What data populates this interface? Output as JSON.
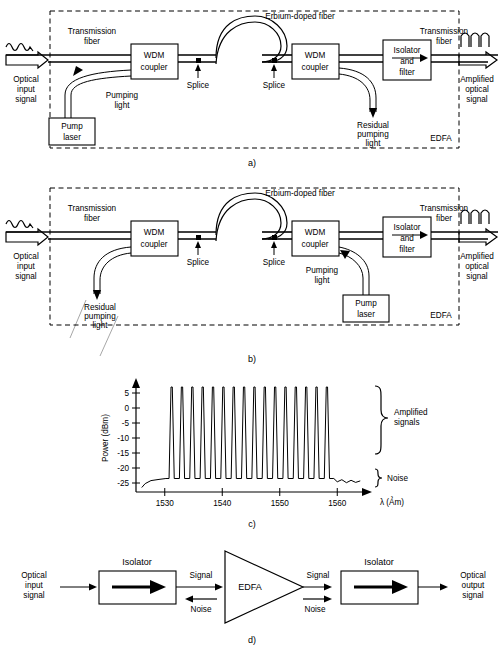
{
  "figure": {
    "panel_captions": {
      "a": "a)",
      "b": "b)",
      "c": "c)",
      "d": "d)"
    }
  },
  "panel_a": {
    "caption": "a)",
    "enclosure_label": "EDFA",
    "labels": {
      "optical_input_signal": [
        "Optical",
        "input",
        "signal"
      ],
      "transmission_fiber_left": [
        "Transmission",
        "fiber"
      ],
      "transmission_fiber_right": [
        "Transmission",
        "fiber"
      ],
      "wdm_coupler_left": [
        "WDM",
        "coupler"
      ],
      "wdm_coupler_right": [
        "WDM",
        "coupler"
      ],
      "pump_laser": [
        "Pump",
        "laser"
      ],
      "pumping_light": [
        "Pumping",
        "light"
      ],
      "residual_pumping_light": [
        "Residual",
        "pumping",
        "light"
      ],
      "splice_left": "Splice",
      "splice_right": "Splice",
      "erbium_doped_fiber": "Erbium-doped fiber",
      "isolator_and_filter": [
        "Isolator",
        "and",
        "filter"
      ],
      "amplified_optical_signal": [
        "Amplified",
        "optical",
        "signal"
      ]
    },
    "pump_position": "co-propagating (forward pumping at input side)"
  },
  "panel_b": {
    "caption": "b)",
    "enclosure_label": "EDFA",
    "labels": {
      "optical_input_signal": [
        "Optical",
        "input",
        "signal"
      ],
      "transmission_fiber_left": [
        "Transmission",
        "fiber"
      ],
      "transmission_fiber_right": [
        "Transmission",
        "fiber"
      ],
      "wdm_coupler_left": [
        "WDM",
        "coupler"
      ],
      "wdm_coupler_right": [
        "WDM",
        "coupler"
      ],
      "pump_laser": [
        "Pump",
        "laser"
      ],
      "pumping_light": [
        "Pumping",
        "light"
      ],
      "residual_pumping_light": [
        "Residual",
        "pumping",
        "light"
      ],
      "splice_left": "Splice",
      "splice_right": "Splice",
      "erbium_doped_fiber": "Erbium-doped fiber",
      "isolator_and_filter": [
        "Isolator",
        "and",
        "filter"
      ],
      "amplified_optical_signal": [
        "Amplified",
        "optical",
        "signal"
      ]
    },
    "pump_position": "counter-propagating (backward pumping at output side)"
  },
  "panel_c": {
    "caption": "c)",
    "annotations": {
      "amplified_signals": [
        "Amplified",
        "signals"
      ],
      "noise": "Noise"
    }
  },
  "chart_data": {
    "type": "line",
    "title": "",
    "xlabel": "λ (Ảm)",
    "ylabel": "Power (dBm)",
    "xlim": [
      1525,
      1565
    ],
    "ylim": [
      -28,
      8
    ],
    "xticks": [
      1530,
      1540,
      1550,
      1560
    ],
    "yticks": [
      5,
      0,
      -5,
      -10,
      -15,
      -20,
      -25
    ],
    "grid": false,
    "legend": null,
    "annotations": [
      {
        "text": "Amplified signals",
        "type": "brace",
        "y_range": [
          -22,
          7
        ]
      },
      {
        "text": "Noise",
        "type": "brace",
        "y_range": [
          -27,
          -22
        ]
      }
    ],
    "noise_floor_dbm": -23.5,
    "peak_power_dbm": 7,
    "channel_count": 16,
    "channel_wavelengths_nm": [
      1531.2,
      1533.0,
      1534.8,
      1536.6,
      1538.4,
      1540.2,
      1542.0,
      1543.8,
      1545.6,
      1547.4,
      1549.2,
      1551.0,
      1552.8,
      1554.6,
      1556.4,
      1558.2
    ],
    "channel_peaks_dbm": [
      7,
      7,
      7,
      7,
      7,
      7,
      7,
      7,
      7,
      7,
      7,
      7,
      7,
      7,
      7,
      7
    ],
    "series": [
      {
        "name": "EDFA output spectrum",
        "description": "16 amplified WDM channels at ~+7 dBm riding on an ASE noise floor near -23.5 dBm between 1530 and 1560 nm"
      }
    ]
  },
  "panel_d": {
    "caption": "d)",
    "labels": {
      "optical_input_signal": [
        "Optical",
        "input",
        "signal"
      ],
      "isolator_left": "Isolator",
      "isolator_right": "Isolator",
      "signal_left": "Signal",
      "noise_left": "Noise",
      "edfa": "EDFA",
      "signal_right": "Signal",
      "noise_right": "Noise",
      "optical_output_signal": [
        "Optical",
        "output",
        "signal"
      ]
    }
  },
  "colors": {
    "line": "#000000",
    "background": "#ffffff"
  }
}
